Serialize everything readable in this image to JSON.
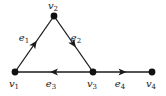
{
  "graph": {
    "type": "directed",
    "colors": {
      "edge": "#1a1a1a",
      "node": "#111111",
      "label": "#222222"
    },
    "nodes": [
      {
        "id": "v1",
        "base": "v",
        "sub": "1",
        "x": 15,
        "y": 72,
        "lx": 14,
        "ly": 87
      },
      {
        "id": "v2",
        "base": "v",
        "sub": "2",
        "x": 54,
        "y": 16,
        "lx": 53,
        "ly": 9
      },
      {
        "id": "v3",
        "base": "v",
        "sub": "3",
        "x": 93,
        "y": 72,
        "lx": 92,
        "ly": 87
      },
      {
        "id": "v4",
        "base": "v",
        "sub": "4",
        "x": 152,
        "y": 72,
        "lx": 151,
        "ly": 87
      }
    ],
    "edges": [
      {
        "id": "e1",
        "base": "e",
        "sub": "1",
        "from": "v1",
        "to": "v2",
        "lx": 24,
        "ly": 41
      },
      {
        "id": "e2",
        "base": "e",
        "sub": "2",
        "from": "v2",
        "to": "v3",
        "lx": 76,
        "ly": 41
      },
      {
        "id": "e3",
        "base": "e",
        "sub": "3",
        "from": "v3",
        "to": "v1",
        "lx": 51,
        "ly": 87
      },
      {
        "id": "e4",
        "base": "e",
        "sub": "4",
        "from": "v3",
        "to": "v4",
        "lx": 120,
        "ly": 87
      }
    ]
  }
}
